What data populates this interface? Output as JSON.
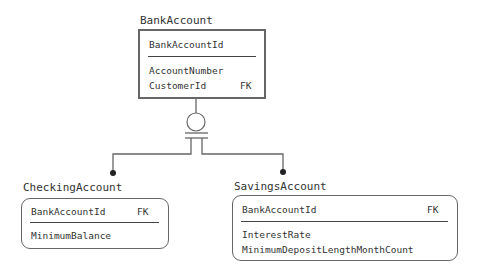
{
  "entities": {
    "bank_account": {
      "title": "BankAccount",
      "key_attributes": [
        {
          "name": "BankAccountId",
          "fk": ""
        }
      ],
      "attributes": [
        {
          "name": "AccountNumber",
          "fk": ""
        },
        {
          "name": "CustomerId",
          "fk": "FK"
        }
      ]
    },
    "checking_account": {
      "title": "CheckingAccount",
      "key_attributes": [
        {
          "name": "BankAccountId",
          "fk": "FK"
        }
      ],
      "attributes": [
        {
          "name": "MinimumBalance",
          "fk": ""
        }
      ]
    },
    "savings_account": {
      "title": "SavingsAccount",
      "key_attributes": [
        {
          "name": "BankAccountId",
          "fk": "FK"
        }
      ],
      "attributes": [
        {
          "name": "InterestRate",
          "fk": ""
        },
        {
          "name": "MinimumDepositLengthMonthCount",
          "fk": ""
        }
      ]
    }
  },
  "relationship": {
    "type": "incomplete-subtype-categorization",
    "parent": "BankAccount",
    "children": [
      "CheckingAccount",
      "SavingsAccount"
    ]
  },
  "colors": {
    "line": "#666666",
    "text": "#333333",
    "background": "#ffffff"
  }
}
